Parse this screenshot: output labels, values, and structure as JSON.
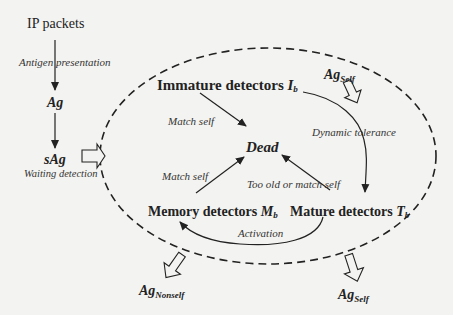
{
  "diagram": {
    "type": "artificial immune detector lifecycle",
    "nodes": {
      "ip_packets": "IP packets",
      "ag": "Ag",
      "sag": "sAg",
      "immature": {
        "label": "Immature detectors ",
        "symbol": "I",
        "subscript": "b"
      },
      "dead": "Dead",
      "mature": {
        "label": "Mature detectors ",
        "symbol": "T",
        "subscript": "b"
      },
      "memory": {
        "label": "Memory detectors ",
        "symbol": "M",
        "subscript": "b"
      },
      "ag_self_in": {
        "base": "Ag",
        "subscript": "Self"
      },
      "ag_nonself_out": {
        "base": "Ag",
        "subscript": "Nonself"
      },
      "ag_self_out": {
        "base": "Ag",
        "subscript": "Self"
      }
    },
    "edges": {
      "antigen_presentation": "Antigen presentation",
      "waiting_detection": "Waiting detection",
      "match_self_immature": "Match self",
      "match_self_memory": "Match self",
      "dynamic_tolerance": "Dynamic tolerance",
      "too_old_or_match_self": "Too old or match self",
      "activation": "Activation"
    },
    "colors": {
      "background": "#f3f3f1",
      "stroke": "#222222"
    }
  }
}
